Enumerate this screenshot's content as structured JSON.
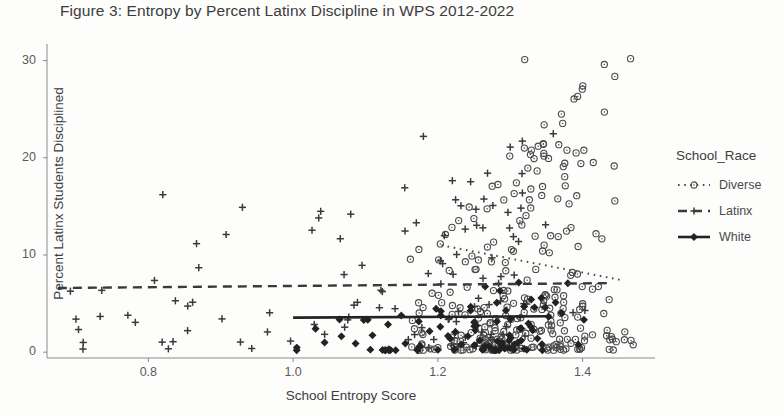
{
  "chart_data": {
    "type": "scatter",
    "title": "Figure 3: Entropy by Percent Latinx Discipline in WPS 2012-2022",
    "xlabel": "School Entropy Score",
    "ylabel": "Percent Latinx Students Disciplined",
    "xlim": [
      0.66,
      1.5
    ],
    "ylim": [
      -0.6,
      31.5
    ],
    "xticks": [
      0.8,
      1.0,
      1.2,
      1.4
    ],
    "xtick_labels": [
      "0.8",
      "1.0",
      "1.2",
      "1.4"
    ],
    "yticks": [
      0,
      10,
      20,
      30
    ],
    "ytick_labels": [
      "0",
      "10",
      "20",
      "30"
    ],
    "grid": false,
    "legend_position": "right",
    "legend_title": "School_Race",
    "series": [
      {
        "name": "Diverse",
        "marker": "open-circle",
        "linetype": "dotted",
        "color": "#4a4a4a",
        "n_points": 268,
        "x_range": [
          1.16,
          1.47
        ],
        "y_range": [
          0.2,
          30.2
        ],
        "x_mode": 1.33,
        "y_skew": "low-heavy",
        "trend": {
          "x0": 1.205,
          "y0": 11.0,
          "x1": 1.455,
          "y1": 7.4
        }
      },
      {
        "name": "Latinx",
        "marker": "plus",
        "linetype": "dashed",
        "color": "#3a3a3a",
        "n_points": 112,
        "x_range": [
          0.69,
          1.41
        ],
        "y_range": [
          0.3,
          22.5
        ],
        "x_mode": 1.22,
        "y_skew": "mid",
        "trend": {
          "x0": 0.675,
          "y0": 6.6,
          "x1": 1.435,
          "y1": 7.1
        }
      },
      {
        "name": "White",
        "marker": "filled-diamond",
        "linetype": "solid",
        "color": "#222222",
        "n_points": 96,
        "x_range": [
          0.99,
          1.41
        ],
        "y_range": [
          0.2,
          8.4
        ],
        "x_mode": 1.28,
        "y_skew": "low-heavy",
        "trend": {
          "x0": 1.0,
          "y0": 3.55,
          "x1": 1.355,
          "y1": 3.7
        }
      }
    ],
    "notable_points": [
      {
        "series": "Latinx",
        "x": 0.82,
        "y": 16.2
      },
      {
        "series": "Latinx",
        "x": 0.93,
        "y": 14.9
      },
      {
        "series": "Latinx",
        "x": 1.18,
        "y": 22.2
      },
      {
        "series": "Latinx",
        "x": 1.3,
        "y": 21.1
      },
      {
        "series": "Diverse",
        "x": 1.32,
        "y": 30.1
      },
      {
        "series": "Diverse",
        "x": 1.43,
        "y": 29.6
      },
      {
        "series": "Latinx",
        "x": 0.7,
        "y": 3.4
      },
      {
        "series": "Latinx",
        "x": 0.71,
        "y": 1.0
      }
    ]
  },
  "legend": {
    "title": "School_Race",
    "items": [
      {
        "label": "Diverse",
        "key": "dotted-open-circle"
      },
      {
        "label": "Latinx",
        "key": "dashed-plus"
      },
      {
        "label": "White",
        "key": "solid-filled-diamond"
      }
    ]
  },
  "plot_area": {
    "left": 47,
    "top": 46,
    "right": 655,
    "bottom": 358
  }
}
